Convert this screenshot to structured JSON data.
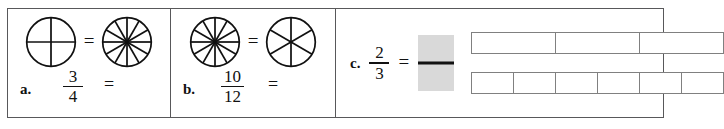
{
  "worksheet": {
    "title": "Equivalent fractions exercise",
    "colors": {
      "border": "#58585a",
      "bar_border": "#808080",
      "answer_box_fill": "#d9d9d9",
      "ink": "#111111"
    }
  },
  "problems": [
    {
      "label": "a.",
      "left_circle": {
        "icon": "pie-circle-icon",
        "sectors": 4
      },
      "relation": "=",
      "right_circle": {
        "icon": "pie-circle-icon",
        "sectors": 12
      },
      "fraction": {
        "numerator": "3",
        "denominator": "4"
      },
      "equals": "="
    },
    {
      "label": "b.",
      "left_circle": {
        "icon": "pie-circle-icon",
        "sectors": 12
      },
      "relation": "=",
      "right_circle": {
        "icon": "pie-circle-icon",
        "sectors": 6
      },
      "fraction": {
        "numerator": "10",
        "denominator": "12"
      },
      "equals": "="
    },
    {
      "label": "c.",
      "fraction": {
        "numerator": "2",
        "denominator": "3"
      },
      "equals": "=",
      "answer_box": {
        "icon": "blank-fraction-placeholder-icon"
      },
      "bar_models": [
        {
          "parts": 3
        },
        {
          "parts": 6
        }
      ]
    }
  ]
}
